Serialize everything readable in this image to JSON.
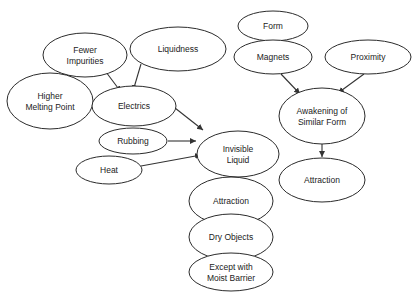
{
  "diagram": {
    "type": "concept-map",
    "colors": {
      "stroke": "#2b2b2b",
      "fill": "#ffffff",
      "text": "#222222",
      "edge": "#333333"
    },
    "nodes": [
      {
        "id": "fewer_impurities",
        "lines": [
          "Fewer",
          "Impurities"
        ],
        "cx": 85,
        "cy": 55,
        "rx": 42,
        "ry": 22
      },
      {
        "id": "liquidness",
        "lines": [
          "Liquidness"
        ],
        "cx": 178,
        "cy": 49,
        "rx": 48,
        "ry": 22
      },
      {
        "id": "higher_melting_point",
        "lines": [
          "Higher",
          "Melting Point"
        ],
        "cx": 50,
        "cy": 101,
        "rx": 43,
        "ry": 28
      },
      {
        "id": "electrics",
        "lines": [
          "Electrics"
        ],
        "cx": 134,
        "cy": 106,
        "rx": 42,
        "ry": 20
      },
      {
        "id": "rubbing",
        "lines": [
          "Rubbing"
        ],
        "cx": 133,
        "cy": 141,
        "rx": 34,
        "ry": 13
      },
      {
        "id": "heat",
        "lines": [
          "Heat"
        ],
        "cx": 109,
        "cy": 170,
        "rx": 33,
        "ry": 14
      },
      {
        "id": "invisible_liquid",
        "lines": [
          "Invisible",
          "Liquid"
        ],
        "cx": 238,
        "cy": 154,
        "rx": 41,
        "ry": 23
      },
      {
        "id": "attraction_left",
        "lines": [
          "Attraction"
        ],
        "cx": 231,
        "cy": 201,
        "rx": 42,
        "ry": 24
      },
      {
        "id": "dry_objects",
        "lines": [
          "Dry Objects"
        ],
        "cx": 231,
        "cy": 237,
        "rx": 42,
        "ry": 23
      },
      {
        "id": "except_moist_barrier",
        "lines": [
          "Except with",
          "Moist Barrier"
        ],
        "cx": 231,
        "cy": 272,
        "rx": 42,
        "ry": 19
      },
      {
        "id": "form",
        "lines": [
          "Form"
        ],
        "cx": 273,
        "cy": 26,
        "rx": 35,
        "ry": 15
      },
      {
        "id": "magnets",
        "lines": [
          "Magnets"
        ],
        "cx": 273,
        "cy": 57,
        "rx": 39,
        "ry": 17
      },
      {
        "id": "proximity",
        "lines": [
          "Proximity"
        ],
        "cx": 368,
        "cy": 57,
        "rx": 43,
        "ry": 17
      },
      {
        "id": "awakening_similar_form",
        "lines": [
          "Awakening of",
          "Similar Form"
        ],
        "cx": 322,
        "cy": 116,
        "rx": 43,
        "ry": 28
      },
      {
        "id": "attraction_right",
        "lines": [
          "Attraction"
        ],
        "cx": 322,
        "cy": 180,
        "rx": 43,
        "ry": 22
      }
    ],
    "edges": [
      {
        "from": "fewer_impurities",
        "to": "electrics",
        "x1": 106,
        "y1": 72,
        "x2": 121,
        "y2": 92
      },
      {
        "from": "liquidness",
        "to": "electrics",
        "x1": 141,
        "y1": 64,
        "x2": 133,
        "y2": 91
      },
      {
        "from": "electrics",
        "to": "invisible_liquid",
        "x1": 175,
        "y1": 108,
        "x2": 203,
        "y2": 130
      },
      {
        "from": "rubbing",
        "to": "invisible_liquid",
        "x1": 168,
        "y1": 141,
        "x2": 196,
        "y2": 141
      },
      {
        "from": "heat",
        "to": "invisible_liquid",
        "x1": 141,
        "y1": 166,
        "x2": 201,
        "y2": 155
      },
      {
        "from": "invisible_liquid",
        "to": "attraction_left",
        "x1": 231,
        "y1": 177,
        "x2": 231,
        "y2": 176
      },
      {
        "from": "magnets",
        "to": "awakening_similar_form",
        "x1": 281,
        "y1": 74,
        "x2": 300,
        "y2": 94
      },
      {
        "from": "proximity",
        "to": "awakening_similar_form",
        "x1": 364,
        "y1": 74,
        "x2": 338,
        "y2": 93
      },
      {
        "from": "awakening_similar_form",
        "to": "attraction_right",
        "x1": 322,
        "y1": 144,
        "x2": 322,
        "y2": 157
      }
    ]
  }
}
